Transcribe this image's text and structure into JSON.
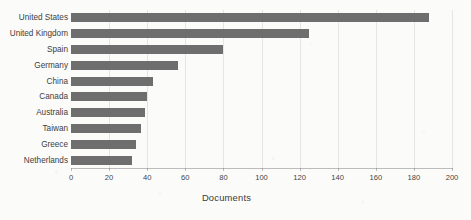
{
  "chart_data": {
    "type": "bar",
    "orientation": "horizontal",
    "title": "",
    "xlabel": "Documents",
    "ylabel": "",
    "xlim": [
      0,
      200
    ],
    "xticks": [
      0,
      20,
      40,
      60,
      80,
      100,
      120,
      140,
      160,
      180,
      200
    ],
    "grid": true,
    "legend": null,
    "bar_color": "#6e6e6e",
    "categories": [
      "United States",
      "United Kingdom",
      "Spain",
      "Germany",
      "China",
      "Canada",
      "Australia",
      "Taiwan",
      "Greece",
      "Netherlands"
    ],
    "values": [
      188,
      125,
      80,
      56,
      43,
      40,
      39,
      37,
      34,
      32
    ]
  }
}
